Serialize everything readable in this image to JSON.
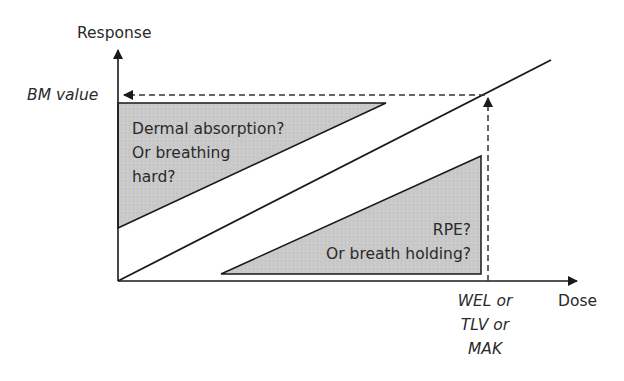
{
  "axes": {
    "y_label": "Response",
    "x_label": "Dose"
  },
  "markers": {
    "bm_value": "BM value",
    "limit_lines": [
      "WEL or",
      "TLV or",
      "MAK"
    ]
  },
  "regions": {
    "upper": {
      "lines": [
        "Dermal absorption?",
        "Or breathing",
        "hard?"
      ],
      "fill": "#c8c8c8"
    },
    "lower": {
      "lines": [
        "RPE?",
        "Or breath holding?"
      ],
      "fill": "#c8c8c8"
    }
  },
  "colors": {
    "line": "#1a1a1a",
    "dash": "#333333",
    "text": "#2a2a2a"
  }
}
